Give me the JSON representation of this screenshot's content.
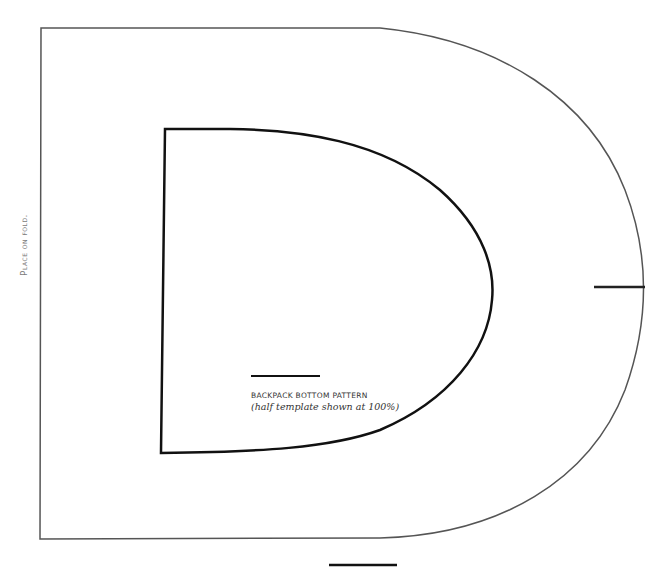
{
  "pattern": {
    "fold_label": "Place on fold.",
    "title": "BACKPACK BOTTOM PATTERN",
    "subtitle": "(half template shown at 100%)",
    "colors": {
      "outer_line": "#555555",
      "inner_line": "#111111",
      "fold_text": "#7a7a7a"
    }
  }
}
